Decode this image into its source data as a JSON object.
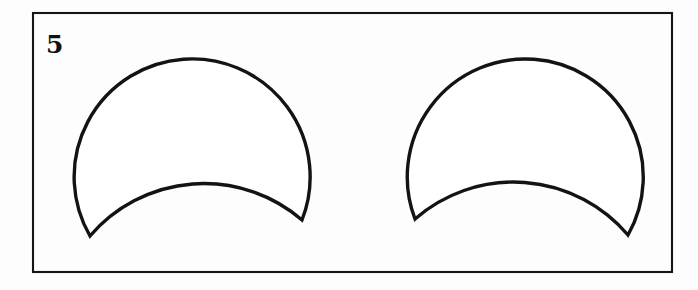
{
  "figure": {
    "number_label": "5",
    "background_color": "#fdfdfd",
    "frame": {
      "name": "figure-panel-border",
      "x": 33,
      "y": 13,
      "width": 639,
      "height": 259,
      "stroke_color": "#151515",
      "stroke_width": 2.1,
      "fill": "none"
    },
    "ink_color": "#131313",
    "shape_fill_color": "#ffffff",
    "shape_stroke_width": 3.4,
    "shape_count": 2,
    "shape_type": "crescent-lune",
    "shapes": [
      {
        "name": "left-crescent",
        "orientation": "cusps-down",
        "mirrored": false,
        "outer_arc": {
          "description": "large convex-up circular arc",
          "start_point": [
            90,
            236
          ],
          "end_point": [
            302,
            220
          ],
          "radius": 118,
          "apex": [
            190,
            53
          ],
          "leftmost": [
            69,
            150
          ],
          "rightmost": [
            304,
            148
          ]
        },
        "inner_arc": {
          "description": "smaller concave-up circular arc",
          "start_point": [
            90,
            236
          ],
          "end_point": [
            302,
            220
          ],
          "radius": 150,
          "apex": [
            196,
            186
          ]
        },
        "cusps": [
          [
            90,
            236
          ],
          [
            302,
            220
          ]
        ]
      },
      {
        "name": "right-crescent",
        "orientation": "cusps-down",
        "mirrored": true,
        "outer_arc": {
          "description": "large convex-up circular arc",
          "start_point": [
            415,
            219
          ],
          "end_point": [
            628,
            235
          ],
          "radius": 118,
          "apex": [
            527,
            53
          ],
          "leftmost": [
            413,
            148
          ],
          "rightmost": [
            648,
            150
          ]
        },
        "inner_arc": {
          "description": "smaller concave-up circular arc",
          "start_point": [
            415,
            219
          ],
          "end_point": [
            628,
            235
          ],
          "radius": 150,
          "apex": [
            521,
            186
          ]
        },
        "cusps": [
          [
            415,
            219
          ],
          [
            628,
            235
          ]
        ]
      }
    ],
    "number_position": {
      "x": 46,
      "y": 53
    }
  }
}
